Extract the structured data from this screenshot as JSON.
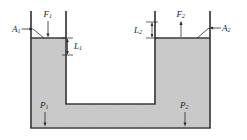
{
  "figure": {
    "type": "physics-diagram",
    "background_color": "#ffffff",
    "fluid_color": "#c9c9c9",
    "outline_color": "#3a3a3a",
    "label_color": "#1a1a1a"
  },
  "labels": {
    "area_left": {
      "symbol": "A",
      "subscript": "1",
      "text": "A"
    },
    "force_left": {
      "symbol": "F",
      "subscript": "1",
      "text": "F"
    },
    "length_left": {
      "symbol": "L",
      "subscript": "1",
      "text": "L"
    },
    "length_right": {
      "symbol": "L",
      "subscript": "2",
      "text": "L"
    },
    "force_right": {
      "symbol": "F",
      "subscript": "2",
      "text": "F"
    },
    "area_right": {
      "symbol": "A",
      "subscript": "2",
      "text": "A"
    },
    "pressure_left": {
      "symbol": "P",
      "subscript": "1",
      "text": "P"
    },
    "pressure_right": {
      "symbol": "P",
      "subscript": "2",
      "text": "P"
    }
  },
  "geometry": {
    "left_outer_wall_x": 31,
    "left_inner_wall_x": 66,
    "right_inner_wall_x": 155,
    "right_outer_wall_x": 210,
    "tube_top_y": 11,
    "fluid_surface_left_y": 38,
    "fluid_surface_right_y": 38,
    "cavity_bottom_y": 104,
    "container_bottom_y": 128,
    "container_bottom_inner_y": 126
  }
}
